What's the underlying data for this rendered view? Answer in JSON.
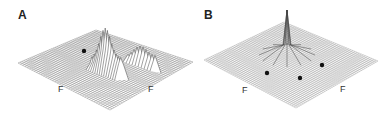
{
  "panels": [
    {
      "label": "A",
      "axis_labels": [
        "F",
        "F"
      ],
      "description": "3D surface plot with broad multi-lobed peak and one marker dot",
      "markers": 1
    },
    {
      "label": "B",
      "axis_labels": [
        "F",
        "F"
      ],
      "description": "3D surface plot with single sharp central peak and three marker dots",
      "markers": 3
    }
  ],
  "colors": {
    "line": "#555555",
    "marker": "#111111",
    "background": "#ffffff"
  }
}
